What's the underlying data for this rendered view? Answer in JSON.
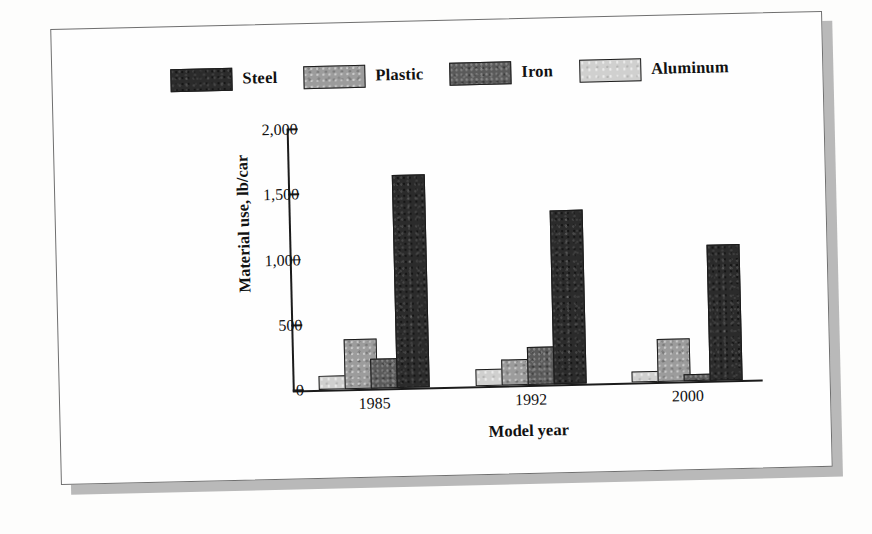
{
  "chart_data": {
    "type": "bar",
    "title": "",
    "subtitle": "",
    "xlabel": "Model year",
    "ylabel": "Material use, lb/car",
    "categories": [
      "1985",
      "1992",
      "2000"
    ],
    "ylim": [
      0,
      2000
    ],
    "yticks": [
      0,
      500,
      1000,
      1500,
      2000
    ],
    "ytick_labels": [
      "0",
      "500",
      "1,000",
      "1,500",
      "2,000"
    ],
    "grid": false,
    "legend_position": "top",
    "units": "lb/car",
    "series": [
      {
        "name": "Steel",
        "color": "#2b2b2b",
        "fill": "fill-steel",
        "values": [
          1630,
          1330,
          1045
        ]
      },
      {
        "name": "Plastic",
        "color": "#9c9c9c",
        "fill": "fill-plastic",
        "values": [
          380,
          200,
          330
        ]
      },
      {
        "name": "Iron",
        "color": "#5a5a5a",
        "fill": "fill-iron",
        "values": [
          230,
          290,
          50
        ]
      },
      {
        "name": "Aluminum",
        "color": "#d0d0cf",
        "fill": "fill-aluminum",
        "values": [
          110,
          130,
          85
        ]
      }
    ],
    "draw_order": [
      "Aluminum",
      "Plastic",
      "Iron",
      "Steel"
    ]
  },
  "legend": {
    "items": [
      {
        "label": "Steel",
        "fill": "fill-steel"
      },
      {
        "label": "Plastic",
        "fill": "fill-plastic"
      },
      {
        "label": "Iron",
        "fill": "fill-iron"
      },
      {
        "label": "Aluminum",
        "fill": "fill-aluminum"
      }
    ]
  },
  "colors": {
    "steel": "#2b2b2b",
    "plastic": "#9c9c9c",
    "iron": "#5a5a5a",
    "aluminum": "#d0d0cf",
    "axis": "#1b1b1b",
    "page": "#fefefe",
    "frame": "#6f6f6f",
    "shadow": "#b9b9b9"
  }
}
